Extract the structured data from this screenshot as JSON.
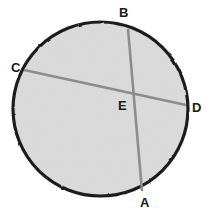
{
  "figure": {
    "background_color": "#ffffff",
    "circle": {
      "name": "circle-outline",
      "center_x": 100.5,
      "center_y": 109,
      "radius_x": 87.5,
      "radius_y": 87,
      "fill_color": "#d9d9d9",
      "stroke_color": "#1c1c1c",
      "stroke_width": 3.2
    },
    "chords": [
      {
        "name": "chord-BA",
        "label": "BA",
        "from_point": "B",
        "to_point": "A",
        "x1": 128,
        "y1": 29,
        "x2": 142,
        "y2": 191,
        "color": "#8c8c8c",
        "width": 2.6
      },
      {
        "name": "chord-CD",
        "label": "CD",
        "from_point": "C",
        "to_point": "D",
        "x1": 24,
        "y1": 70,
        "x2": 186,
        "y2": 105,
        "color": "#8c8c8c",
        "width": 2.6
      }
    ],
    "intersection": {
      "name": "point-E",
      "label": "E",
      "x": 134,
      "y": 93
    },
    "labels": [
      {
        "id": "A",
        "text": "A",
        "x": 140,
        "y": 196,
        "color": "#1a1a1a"
      },
      {
        "id": "B",
        "text": "B",
        "x": 119,
        "y": 6,
        "color": "#1a1a1a"
      },
      {
        "id": "C",
        "text": "C",
        "x": 11,
        "y": 61,
        "color": "#1a1a1a"
      },
      {
        "id": "D",
        "text": "D",
        "x": 192,
        "y": 101,
        "color": "#1a1a1a"
      },
      {
        "id": "E",
        "text": "E",
        "x": 118,
        "y": 99,
        "color": "#1a1a1a"
      }
    ]
  }
}
